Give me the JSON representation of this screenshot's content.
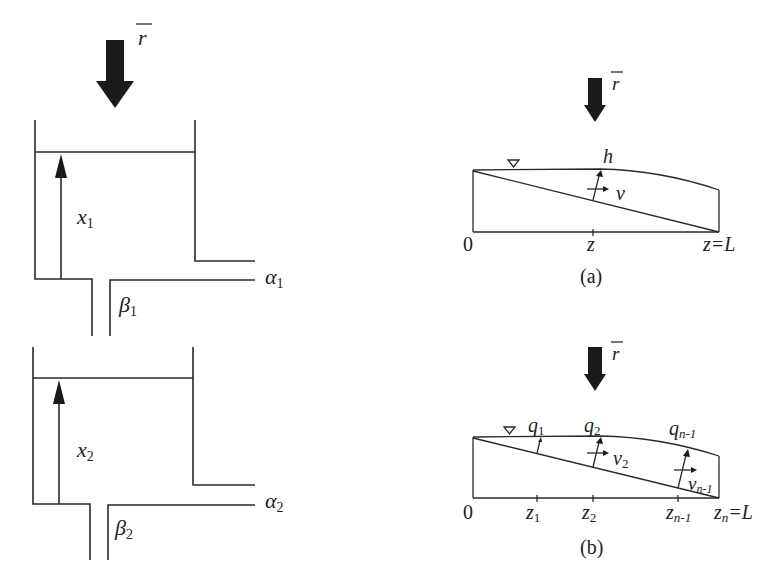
{
  "figure": {
    "left_panel": {
      "rainfall_label": "r",
      "tank1": {
        "level_label": "x",
        "level_sub": "1",
        "side_outlet_label": "α",
        "side_outlet_sub": "1",
        "bottom_outlet_label": "β",
        "bottom_outlet_sub": "1"
      },
      "tank2": {
        "level_label": "x",
        "level_sub": "2",
        "side_outlet_label": "α",
        "side_outlet_sub": "2",
        "bottom_outlet_label": "β",
        "bottom_outlet_sub": "2"
      }
    },
    "panel_a": {
      "rainfall_label": "r",
      "depth_label": "h",
      "velocity_label": "v",
      "origin_label": "0",
      "position_label": "z",
      "end_label": "z=L",
      "caption": "(a)",
      "water_surface_symbol": "▽"
    },
    "panel_b": {
      "rainfall_label": "r",
      "flow_labels": [
        {
          "q": "q",
          "sub": "1"
        },
        {
          "q": "q",
          "sub": "2"
        },
        {
          "q": "q",
          "sub": "n-1"
        }
      ],
      "velocity_labels": [
        {
          "v": "v",
          "sub": "2"
        },
        {
          "v": "v",
          "sub": "n-1"
        }
      ],
      "origin_label": "0",
      "node_labels": [
        {
          "z": "z",
          "sub": "1"
        },
        {
          "z": "z",
          "sub": "2"
        },
        {
          "z": "z",
          "sub": "n-1"
        }
      ],
      "end_label": {
        "z": "z",
        "sub": "n",
        "rest": "=L"
      },
      "caption": "(b)",
      "water_surface_symbol": "▽"
    }
  }
}
